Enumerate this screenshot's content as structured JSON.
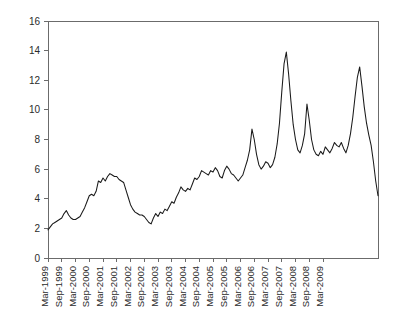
{
  "chart_data": {
    "type": "line",
    "title": "",
    "subtitle": "",
    "xlabel": "",
    "ylabel": "",
    "ylim": [
      0,
      16
    ],
    "ytick_values": [
      0,
      2,
      4,
      6,
      8,
      10,
      12,
      14,
      16
    ],
    "ytick_labels": [
      "0",
      "2",
      "4",
      "6",
      "8",
      "10",
      "12",
      "14",
      "16"
    ],
    "grid": false,
    "legend": "none",
    "x_tick_labels": [
      "Mar-1999",
      "Sep-1999",
      "Mar-2000",
      "Sep-2000",
      "Mar-2001",
      "Sep-2001",
      "Mar-2002",
      "Sep-2002",
      "Mar-2003",
      "Sep-2003",
      "Mar-2004",
      "Sep-2004",
      "Mar-2005",
      "Sep-2005",
      "Mar-2006",
      "Sep-2006",
      "Mar-2007",
      "Sep-2007",
      "Mar-2008",
      "Sep-2008",
      "Mar-2009"
    ],
    "x_tick_interval_months": 6,
    "x_start": "Mar-1999",
    "x_end": "Mar-2009",
    "series": [
      {
        "name": "series-1",
        "color": "#1a1a1a",
        "x_labels": [
          "Mar-1999",
          "Apr-1999",
          "May-1999",
          "Jun-1999",
          "Jul-1999",
          "Aug-1999",
          "Sep-1999",
          "Oct-1999",
          "Nov-1999",
          "Dec-1999",
          "Jan-2000",
          "Feb-2000",
          "Mar-2000",
          "Apr-2000",
          "May-2000",
          "Jun-2000",
          "Jul-2000",
          "Aug-2000",
          "Sep-2000",
          "Oct-2000",
          "Nov-2000",
          "Dec-2000",
          "Jan-2001",
          "Feb-2001",
          "Mar-2001",
          "Apr-2001",
          "May-2001",
          "Jun-2001",
          "Jul-2001",
          "Aug-2001",
          "Sep-2001",
          "Oct-2001",
          "Nov-2001",
          "Dec-2001",
          "Jan-2002",
          "Feb-2002",
          "Mar-2002",
          "Apr-2002",
          "May-2002",
          "Jun-2002",
          "Jul-2002",
          "Aug-2002",
          "Sep-2002",
          "Oct-2002",
          "Nov-2002",
          "Dec-2002",
          "Jan-2003",
          "Feb-2003",
          "Mar-2003",
          "Apr-2003",
          "May-2003",
          "Jun-2003",
          "Jul-2003",
          "Aug-2003",
          "Sep-2003",
          "Oct-2003",
          "Nov-2003",
          "Dec-2003",
          "Jan-2004",
          "Feb-2004",
          "Mar-2004",
          "Apr-2004",
          "May-2004",
          "Jun-2004",
          "Jul-2004",
          "Aug-2004",
          "Sep-2004",
          "Oct-2004",
          "Nov-2004",
          "Dec-2004",
          "Jan-2005",
          "Feb-2005",
          "Mar-2005",
          "Apr-2005",
          "May-2005",
          "Jun-2005",
          "Jul-2005",
          "Aug-2005",
          "Sep-2005",
          "Oct-2005",
          "Nov-2005",
          "Dec-2005",
          "Jan-2006",
          "Feb-2006",
          "Mar-2006",
          "Apr-2006",
          "May-2006",
          "Jun-2006",
          "Jul-2006",
          "Aug-2006",
          "Sep-2006",
          "Oct-2006",
          "Nov-2006",
          "Dec-2006",
          "Jan-2007",
          "Feb-2007",
          "Mar-2007",
          "Apr-2007",
          "May-2007",
          "Jun-2007",
          "Jul-2007",
          "Aug-2007",
          "Sep-2007",
          "Oct-2007",
          "Nov-2007",
          "Dec-2007",
          "Jan-2008",
          "Feb-2008",
          "Mar-2008",
          "Apr-2008",
          "May-2008",
          "Jun-2008",
          "Jul-2008",
          "Aug-2008",
          "Sep-2008",
          "Oct-2008",
          "Nov-2008",
          "Dec-2008",
          "Jan-2009",
          "Feb-2009",
          "Mar-2009"
        ],
        "values": [
          1.9,
          2.1,
          2.3,
          2.4,
          2.5,
          2.6,
          2.7,
          3.0,
          3.2,
          2.9,
          2.7,
          2.6,
          2.6,
          2.7,
          2.8,
          3.1,
          3.4,
          3.8,
          4.2,
          4.3,
          4.2,
          4.5,
          5.2,
          5.1,
          5.4,
          5.2,
          5.5,
          5.7,
          5.6,
          5.5,
          5.5,
          5.3,
          5.2,
          5.1,
          4.6,
          4.1,
          3.6,
          3.3,
          3.1,
          3.0,
          2.9,
          2.9,
          2.8,
          2.6,
          2.4,
          2.3,
          2.7,
          3.0,
          2.8,
          3.1,
          3.0,
          3.3,
          3.2,
          3.5,
          3.8,
          3.7,
          4.1,
          4.4,
          4.8,
          4.6,
          4.5,
          4.7,
          4.6,
          5.0,
          5.4,
          5.3,
          5.5,
          5.9,
          5.8,
          5.7,
          5.6,
          5.9,
          5.8,
          6.1,
          5.9,
          5.5,
          5.4,
          5.9,
          6.2,
          6.0,
          5.7,
          5.6,
          5.4,
          5.2,
          5.4,
          5.6,
          6.1,
          6.6,
          7.3,
          8.7,
          8.0,
          7.0,
          6.3,
          6.0,
          6.2,
          6.5,
          6.4,
          6.1,
          6.3,
          6.8,
          7.7,
          9.1,
          11.2,
          13.1,
          13.9,
          12.4,
          10.6,
          9.0,
          8.0,
          7.3,
          7.1,
          7.6,
          8.4,
          10.4,
          9.3,
          8.0,
          7.3,
          7.0,
          6.9,
          7.2,
          7.0,
          7.5,
          7.3,
          7.1,
          7.4,
          7.8,
          7.6,
          7.5,
          7.8,
          7.4,
          7.1,
          7.6,
          8.4,
          9.5,
          10.9,
          12.2,
          12.9,
          11.6,
          10.2,
          9.1,
          8.3,
          7.6,
          6.5,
          5.2,
          4.2
        ]
      }
    ]
  },
  "axes": {
    "x_axis_name": "time-axis",
    "y_axis_name": "value-axis"
  }
}
